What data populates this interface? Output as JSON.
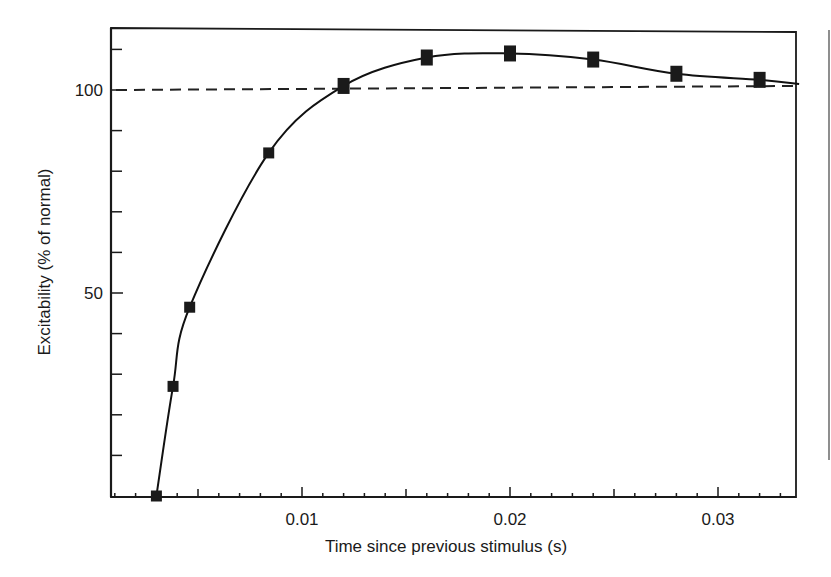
{
  "chart_data": {
    "type": "line",
    "title": "",
    "xlabel": "Time since previous stimulus (s)",
    "ylabel": "Excitability (% of normal)",
    "xlim": [
      0.0008,
      0.0339
    ],
    "ylim": [
      0,
      115
    ],
    "x_major_ticks": [
      0.01,
      0.02,
      0.03
    ],
    "x_tick_labels": [
      "0.01",
      "0.02",
      "0.03"
    ],
    "x_minor_tick_step": 0.001,
    "y_major_ticks": [
      50,
      100
    ],
    "y_tick_labels": [
      "50",
      "100"
    ],
    "y_minor_tick_step": 10,
    "grid": false,
    "legend": null,
    "reference_line": {
      "y": 100,
      "style": "dashed",
      "label": "normal excitability"
    },
    "series": [
      {
        "name": "Measured excitability",
        "marker": "square",
        "line": "smooth fitted curve",
        "x": [
          0.003,
          0.0038,
          0.0046,
          0.0084,
          0.012,
          0.016,
          0.02,
          0.024,
          0.028,
          0.032
        ],
        "y": [
          0,
          27,
          46.5,
          84.5,
          101,
          108,
          109,
          107.5,
          104,
          102.5
        ]
      }
    ],
    "curve_end": {
      "x": 0.0339,
      "y": 101.5
    }
  },
  "colors": {
    "ink": "#1a1a1a",
    "background": "#ffffff"
  }
}
